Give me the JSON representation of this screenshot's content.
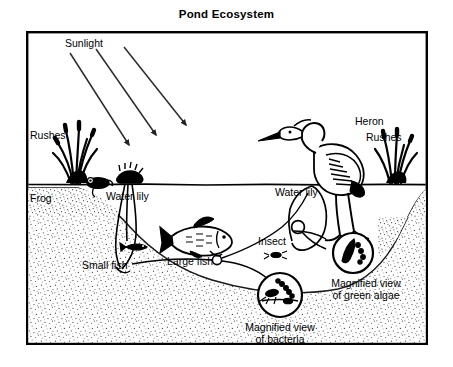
{
  "figure": {
    "title": "Pond Ecosystem",
    "type": "labeled-diagram",
    "frame": {
      "border_color": "#000000",
      "background_color": "#ffffff"
    }
  },
  "colors": {
    "ink": "#000000",
    "paper": "#ffffff",
    "sediment_stipple": "#5a5a5a"
  },
  "labels": {
    "sunlight": "Sunlight",
    "rushes_left": "Rushes",
    "rushes_right": "Rushes",
    "frog": "Frog",
    "water_lily_left": "Water lily",
    "water_lily_right": "Water lily",
    "heron": "Heron",
    "small_fish": "Small fish",
    "large_fish": "Large fish",
    "insect": "Insect",
    "magnified_algae_line1": "Magnified view",
    "magnified_algae_line2": "of green algae",
    "magnified_bacteria_line1": "Magnified view",
    "magnified_bacteria_line2": "of bacteria"
  },
  "features": {
    "sunlight_rays": 3,
    "waterline": "horizontal surface line across pond",
    "sediment": "stippled pond bed and banks",
    "magnifier_circles": 2
  }
}
